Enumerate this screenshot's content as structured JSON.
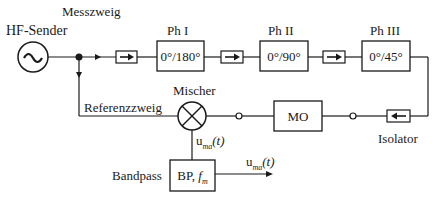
{
  "labels": {
    "hf_sender": "HF-Sender",
    "messzweig": "Messzweig",
    "referenzzweig": "Referenzzweig",
    "mischer": "Mischer",
    "isolator": "Isolator",
    "bandpass": "Bandpass",
    "u_mixer_main": "u",
    "u_mixer_sub": "ma",
    "u_mixer_arg": "(t)",
    "u_out_main": "u",
    "u_out_sub": "ma",
    "u_out_arg": "(t)"
  },
  "phase_shifters": [
    {
      "title": "Ph I",
      "value": "0°/180°"
    },
    {
      "title": "Ph II",
      "value": "0°/90°"
    },
    {
      "title": "Ph III",
      "value": "0°/45°"
    }
  ],
  "blocks": {
    "mo": "MO",
    "bp_main": "BP, ",
    "bp_f": "f",
    "bp_sub": "m"
  },
  "icons": {
    "source": "sine-wave-source-icon",
    "mixer": "mixer-cross-icon",
    "isolator": "isolator-arrow-icon"
  }
}
